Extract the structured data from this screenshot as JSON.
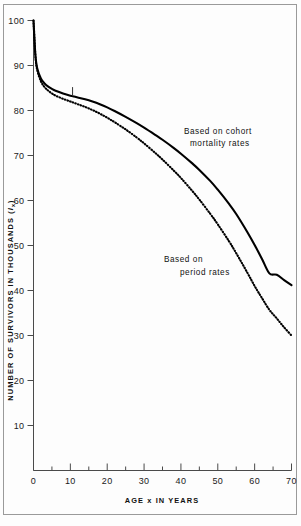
{
  "chart_data": {
    "type": "line",
    "title": "",
    "xlabel": "AGE x IN YEARS",
    "ylabel": "NUMBER OF SURVIVORS IN THOUSANDS (lx)",
    "ylabel_main": "NUMBER OF SURVIVORS IN THOUSANDS (",
    "ylabel_sym": "l",
    "ylabel_sub": "x",
    "ylabel_close": ")",
    "xlim": [
      0,
      70
    ],
    "ylim": [
      0,
      100
    ],
    "xticks": [
      0,
      10,
      20,
      30,
      40,
      50,
      60,
      70
    ],
    "xticklabels": [
      "0",
      "10",
      "20",
      "30",
      "40",
      "50",
      "60",
      "70"
    ],
    "yticks": [
      10,
      20,
      30,
      40,
      50,
      60,
      70,
      80,
      90,
      100
    ],
    "yticklabels": [
      "10",
      "20",
      "30",
      "40",
      "50",
      "60",
      "70",
      "80",
      "90",
      "100"
    ],
    "xminorticks": [
      5,
      15,
      25,
      35,
      45,
      55,
      65
    ],
    "grid": false,
    "legend_position": "inline-annotations",
    "annotations": [
      {
        "name": "cohort-annotation",
        "line1": "Based  on  cohort",
        "line2": "mortality rates",
        "x": 48.5,
        "y": 72
      },
      {
        "name": "period-annotation",
        "line1": "Based on",
        "line2": "period rates",
        "x": 40,
        "y": 44.5
      }
    ],
    "series": [
      {
        "name": "Based on cohort mortality rates",
        "style": "solid",
        "x": [
          0,
          0.5,
          1,
          2,
          3,
          4,
          5,
          6,
          8,
          10,
          11,
          12,
          14,
          16,
          18,
          20,
          22,
          25,
          28,
          30,
          33,
          35,
          38,
          40,
          43,
          45,
          48,
          50,
          53,
          55,
          58,
          60,
          62,
          64,
          66,
          68,
          70
        ],
        "values": [
          100,
          92.5,
          89.4,
          87.1,
          86.0,
          85.3,
          84.8,
          84.4,
          83.8,
          83.3,
          83.1,
          82.9,
          82.5,
          82.0,
          81.4,
          80.7,
          79.9,
          78.6,
          77.2,
          76.2,
          74.6,
          73.5,
          71.7,
          70.4,
          68.3,
          66.8,
          64.3,
          62.4,
          59.3,
          57.0,
          53.0,
          50.1,
          47.0,
          43.8,
          43.5,
          42.3,
          41.2
        ]
      },
      {
        "name": "Based on period rates",
        "style": "dotted",
        "x": [
          0,
          0.5,
          1,
          2,
          3,
          4,
          5,
          6,
          8,
          10,
          11,
          12,
          14,
          16,
          18,
          20,
          22,
          25,
          28,
          30,
          33,
          35,
          38,
          40,
          43,
          45,
          48,
          50,
          53,
          55,
          58,
          60,
          62,
          64,
          66,
          68,
          70
        ],
        "values": [
          100,
          92.3,
          89.0,
          86.5,
          85.2,
          84.4,
          83.8,
          83.3,
          82.6,
          82.0,
          81.7,
          81.4,
          80.8,
          80.1,
          79.3,
          78.4,
          77.4,
          75.8,
          74.0,
          72.7,
          70.6,
          69.1,
          66.7,
          65.0,
          62.2,
          60.2,
          57.0,
          54.7,
          51.0,
          48.3,
          44.0,
          41.0,
          38.3,
          35.7,
          33.8,
          31.8,
          30.0
        ]
      }
    ],
    "curve_markers": [
      {
        "name": "cohort-age-marker",
        "x": 10.6,
        "y": 83.2
      }
    ]
  }
}
